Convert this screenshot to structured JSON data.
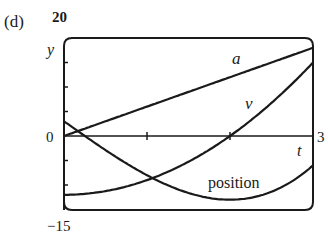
{
  "panel_label": "(d)",
  "chart_data": {
    "type": "line",
    "title": "",
    "xlabel": "t",
    "ylabel": "y",
    "xlim": [
      0,
      3
    ],
    "ylim": [
      -15,
      20
    ],
    "x_ticks": [
      0,
      1,
      2,
      3
    ],
    "x_tick_labels": [
      "3"
    ],
    "y_tick_labels": [
      "20",
      "0",
      "-15"
    ],
    "y_ticks": [
      -15,
      -10,
      -5,
      0,
      5,
      10,
      15,
      20
    ],
    "grid": false,
    "legend": "none (curves labeled inline)",
    "x": [
      0,
      0.25,
      0.5,
      0.75,
      1,
      1.25,
      1.5,
      1.75,
      2,
      2.25,
      2.5,
      2.75,
      3
    ],
    "series": [
      {
        "name": "a",
        "label": "a",
        "values": [
          0,
          1.5,
          3,
          4.5,
          6,
          7.5,
          9,
          10.5,
          12,
          13.5,
          15,
          16.5,
          18
        ]
      },
      {
        "name": "v",
        "label": "v",
        "values": [
          -12,
          -11.81,
          -11.25,
          -10.31,
          -9,
          -7.31,
          -5.25,
          -2.81,
          0,
          3.19,
          6.75,
          10.69,
          15
        ]
      },
      {
        "name": "position",
        "label": "position",
        "values": [
          3,
          0.02,
          -2.88,
          -5.58,
          -8,
          -10.05,
          -11.63,
          -12.64,
          -13,
          -12.61,
          -11.38,
          -6.2,
          -6
        ]
      }
    ]
  },
  "labels": {
    "y_top": "20",
    "y_zero": "0",
    "y_bottom": "−15",
    "y_axis": "y",
    "x_axis": "t",
    "x_end": "3",
    "curve_a": "a",
    "curve_v": "v",
    "curve_position": "position"
  }
}
